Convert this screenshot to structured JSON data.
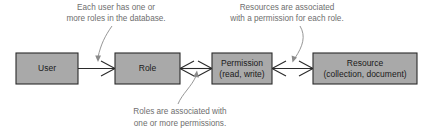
{
  "diagram": {
    "background_color": "#ffffff",
    "box_fill_color": "#a9a9a9",
    "box_border_color": "#2b2b2b",
    "annotation_color": "#6e6e6e",
    "entities": [
      {
        "id": "user",
        "label_line1": "User",
        "label_line2": ""
      },
      {
        "id": "role",
        "label_line1": "Role",
        "label_line2": ""
      },
      {
        "id": "permission",
        "label_line1": "Permission",
        "label_line2": "(read, write)"
      },
      {
        "id": "resource",
        "label_line1": "Resource",
        "label_line2": "(collection, document)"
      }
    ],
    "annotations": [
      {
        "id": "user-role-note",
        "line1": "Each user has one or",
        "line2": "more roles in the database."
      },
      {
        "id": "permission-resource-note",
        "line1": "Resources are associated",
        "line2": "with a permission for each role."
      },
      {
        "id": "role-permission-note",
        "line1": "Roles are associated with",
        "line2": "one or more permissions."
      }
    ],
    "relationships": [
      {
        "id": "user-to-role",
        "from": "user",
        "to": "role",
        "from_cardinality": "one",
        "to_cardinality": "many"
      },
      {
        "id": "role-to-permission",
        "from": "role",
        "to": "permission",
        "from_cardinality": "many",
        "to_cardinality": "many"
      },
      {
        "id": "permission-to-resource",
        "from": "permission",
        "to": "resource",
        "from_cardinality": "many",
        "to_cardinality": "many"
      }
    ]
  }
}
